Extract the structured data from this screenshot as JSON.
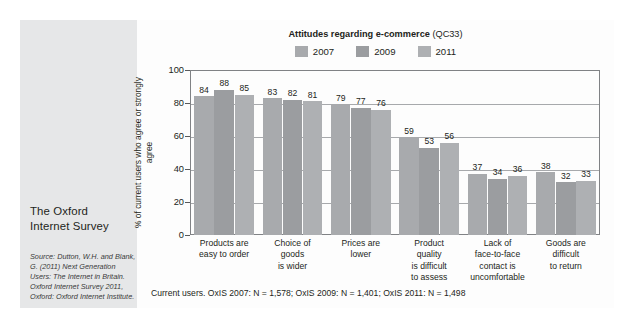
{
  "sidebar": {
    "heading": "The Oxford\nInternet Survey",
    "source": "Source: Dutton, W.H. and Blank, G. (2011) Next Generation Users: The Internet in Britain. Oxford Internet Survey 2011, Oxford: Oxford Internet Institute."
  },
  "chart": {
    "title_main": "Attitudes regarding e-commerce",
    "title_code": "(QC33)",
    "footnote": "Current users. OxIS 2007: N = 1,578; OxIS 2009: N = 1,401; OxIS 2011: N = 1,498"
  },
  "colors": {
    "bar_2007": "#a8aaad",
    "bar_2009": "#9b9da0",
    "bar_2011": "#aeb0b3",
    "sidebar_bg": "#e6e7e8",
    "axis": "#808285",
    "grid": "#a7a9ac",
    "text": "#231f20"
  },
  "chart_data": {
    "type": "bar",
    "xlabel": "",
    "ylabel": "% of current users who agree or strongly agree",
    "ylim": [
      0,
      100
    ],
    "yticks": [
      0,
      20,
      40,
      60,
      80,
      100
    ],
    "grid": true,
    "legend_position": "top-center",
    "categories": [
      "Products are easy to order",
      "Choice of goods is wider",
      "Prices are lower",
      "Product quality is difficult to assess",
      "Lack of face-to-face contact is uncomfortable",
      "Goods are difficult to return"
    ],
    "category_lines": [
      [
        "Products are",
        "easy to order"
      ],
      [
        "Choice of",
        "goods",
        "is wider"
      ],
      [
        "Prices are",
        "lower"
      ],
      [
        "Product",
        "quality",
        "is difficult",
        "to assess"
      ],
      [
        "Lack of",
        "face-to-face",
        "contact is",
        "uncomfortable"
      ],
      [
        "Goods are",
        "difficult",
        "to return"
      ]
    ],
    "series": [
      {
        "name": "2007",
        "values": [
          84,
          83,
          79,
          59,
          37,
          38
        ]
      },
      {
        "name": "2009",
        "values": [
          88,
          82,
          77,
          53,
          34,
          32
        ]
      },
      {
        "name": "2011",
        "values": [
          85,
          81,
          76,
          56,
          36,
          33
        ]
      }
    ]
  }
}
